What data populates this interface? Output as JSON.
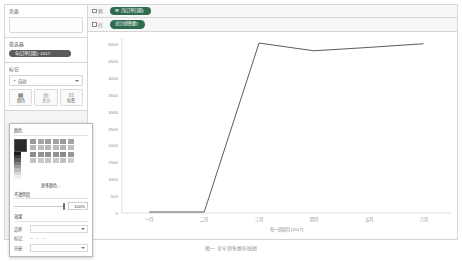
{
  "app": {
    "left_panel": {
      "pages": {
        "title": "页面",
        "value": ""
      },
      "filters": {
        "title": "筛选器",
        "pills": [
          {
            "label": "年(订单日期): 2017"
          }
        ]
      },
      "marks": {
        "title": "标记",
        "type_value": "自动",
        "buttons": [
          {
            "icon": "color-palette-icon",
            "label": "颜色"
          },
          {
            "icon": "size-circle-icon",
            "label": "大小"
          },
          {
            "icon": "label-tag-icon",
            "label": "标签"
          }
        ]
      },
      "color_popup": {
        "title": "颜色",
        "more_colors_label": "更多颜色...",
        "opacity_label": "不透明度",
        "opacity_value": "100%",
        "effects_title": "效果",
        "effects": [
          {
            "label": "边界"
          },
          {
            "label": "标记",
            "options": [
              "无",
              "实线",
              "虚线"
            ]
          },
          {
            "label": "光晕"
          }
        ],
        "current_color": "#2a2a2a",
        "ramp": [
          "#1a1a1a",
          "#3a3a3a",
          "#5e5e5e",
          "#7e7e7e",
          "#9d9d9d",
          "#bbbbbb",
          "#d8d8d8",
          "#f0f0f0"
        ],
        "palette_columns": [
          [
            "#9a9a9a",
            "#b4b4b4",
            "#8c8c8c",
            "#c2c2c2"
          ],
          [
            "#a6a6a6",
            "#bdbdbd",
            "#949494",
            "#cbcbcb"
          ],
          [
            "#9e9e9e",
            "#b8b8b8",
            "#8f8f8f",
            "#c6c6c6"
          ],
          [
            "#a2a2a2",
            "#bbbbbb",
            "#929292",
            "#c9c9c9"
          ],
          [
            "#999999",
            "#b2b2b2",
            "#8a8a8a",
            "#c0c0c0"
          ],
          [
            "#a4a4a4",
            "#bebebe",
            "#969696",
            "#cdcdcd"
          ]
        ]
      }
    },
    "shelves": {
      "columns": {
        "label": "列",
        "pill": "月(订单日期)"
      },
      "rows": {
        "label": "行",
        "pill": "总计(销售额)"
      }
    }
  },
  "chart_data": {
    "type": "line",
    "title": "",
    "xlabel": "每一周周月 [2017]",
    "ylabel": "",
    "categories": [
      "一月",
      "二月",
      "三月",
      "四月",
      "五月",
      "六月"
    ],
    "values": [
      30,
      30,
      5050,
      4820,
      4920,
      5030
    ],
    "ylim": [
      0,
      5200
    ],
    "yticks": [
      0,
      500,
      1000,
      1500,
      2000,
      2500,
      3000,
      3500,
      4000,
      4500,
      5000
    ],
    "ytick_labels": [
      "0",
      "500",
      "1000",
      "1500",
      "2000",
      "2500",
      "3000",
      "3500",
      "4000",
      "4500",
      "5000"
    ],
    "grid": false,
    "line_color": "#4a4a4a",
    "legend": "none"
  },
  "figure_caption": "图一    全年销售额折线图"
}
